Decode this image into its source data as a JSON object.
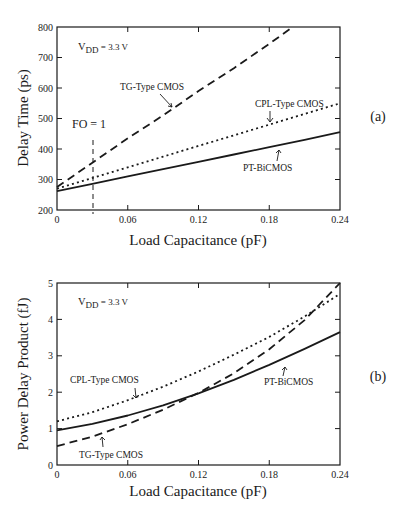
{
  "chart_data": [
    {
      "id": "a",
      "type": "line",
      "panel_label": "(a)",
      "xlabel": "Load Capacitance  (pF)",
      "ylabel": "Delay Time  (ps)",
      "xlim": [
        0,
        0.24
      ],
      "ylim": [
        200,
        800
      ],
      "xticks": [
        0,
        0.06,
        0.12,
        0.18,
        0.24
      ],
      "xtick_labels": [
        "0",
        "0.06",
        "0.12",
        "0.18",
        "0.24"
      ],
      "yticks": [
        200,
        300,
        400,
        500,
        600,
        700,
        800
      ],
      "ytick_labels": [
        "200",
        "300",
        "400",
        "500",
        "600",
        "700",
        "800"
      ],
      "condition_label": {
        "main": "V",
        "sub": "DD",
        "rest": " = 3.3 V"
      },
      "fanout_marker": {
        "label": "FO = 1",
        "x": 0.031
      },
      "series": [
        {
          "name": "TG-Type CMOS",
          "style": "dashed",
          "x": [
            0,
            0.03,
            0.06,
            0.09,
            0.12,
            0.15,
            0.18,
            0.2
          ],
          "values": [
            275,
            355,
            435,
            510,
            590,
            665,
            745,
            800
          ]
        },
        {
          "name": "CPL-Type CMOS",
          "style": "dotted",
          "x": [
            0,
            0.03,
            0.06,
            0.09,
            0.12,
            0.15,
            0.18,
            0.21,
            0.24
          ],
          "values": [
            270,
            305,
            340,
            375,
            410,
            445,
            480,
            515,
            550
          ]
        },
        {
          "name": "PT-BiCMOS",
          "style": "solid",
          "x": [
            0,
            0.03,
            0.06,
            0.09,
            0.12,
            0.15,
            0.18,
            0.21,
            0.24
          ],
          "values": [
            262,
            286,
            310,
            334,
            358,
            382,
            406,
            430,
            455
          ]
        }
      ],
      "annotations": [
        {
          "text": "TG-Type CMOS",
          "series": "TG-Type CMOS"
        },
        {
          "text": "CPL-Type CMOS",
          "series": "CPL-Type CMOS"
        },
        {
          "text": "PT-BiCMOS",
          "series": "PT-BiCMOS"
        }
      ]
    },
    {
      "id": "b",
      "type": "line",
      "panel_label": "(b)",
      "xlabel": "Load Capacitance  (pF)",
      "ylabel": "Power Delay Product  (fJ)",
      "xlim": [
        0,
        0.24
      ],
      "ylim": [
        0,
        5
      ],
      "xticks": [
        0,
        0.06,
        0.12,
        0.18,
        0.24
      ],
      "xtick_labels": [
        "0",
        "0.06",
        "0.12",
        "0.18",
        "0.24"
      ],
      "yticks": [
        0,
        1,
        2,
        3,
        4,
        5
      ],
      "ytick_labels": [
        "0",
        "1",
        "2",
        "3",
        "4",
        "5"
      ],
      "condition_label": {
        "main": "V",
        "sub": "DD",
        "rest": " = 3.3 V"
      },
      "series": [
        {
          "name": "TG-Type CMOS",
          "style": "dashed",
          "x": [
            0,
            0.03,
            0.06,
            0.09,
            0.12,
            0.15,
            0.18,
            0.21,
            0.24
          ],
          "values": [
            0.52,
            0.78,
            1.12,
            1.52,
            1.98,
            2.52,
            3.18,
            3.98,
            5.0
          ]
        },
        {
          "name": "CPL-Type CMOS",
          "style": "dotted",
          "x": [
            0,
            0.03,
            0.06,
            0.09,
            0.12,
            0.15,
            0.18,
            0.21,
            0.24
          ],
          "values": [
            1.2,
            1.45,
            1.78,
            2.15,
            2.57,
            3.03,
            3.52,
            4.08,
            4.7
          ]
        },
        {
          "name": "PT-BiCMOS",
          "style": "solid",
          "x": [
            0,
            0.03,
            0.06,
            0.09,
            0.12,
            0.15,
            0.18,
            0.21,
            0.24
          ],
          "values": [
            0.95,
            1.13,
            1.36,
            1.64,
            1.97,
            2.34,
            2.75,
            3.19,
            3.65
          ]
        }
      ],
      "annotations": [
        {
          "text": "CPL-Type CMOS",
          "series": "CPL-Type CMOS"
        },
        {
          "text": "TG-Type CMOS",
          "series": "TG-Type CMOS"
        },
        {
          "text": "PT-BiCMOS",
          "series": "PT-BiCMOS"
        }
      ]
    }
  ],
  "layout": {
    "panels": [
      {
        "left": 57,
        "right": 340,
        "top": 27,
        "bottom": 210
      },
      {
        "left": 57,
        "right": 340,
        "top": 283,
        "bottom": 465
      }
    ],
    "line_color": "#1a1a1a"
  }
}
